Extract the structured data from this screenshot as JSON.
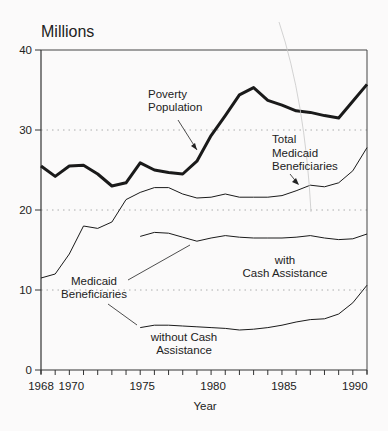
{
  "chart_data": {
    "type": "line",
    "title": "Millions",
    "xlabel": "Year",
    "ylabel": "Millions",
    "xlim": [
      1968,
      1991
    ],
    "ylim": [
      0,
      40
    ],
    "x_ticks": [
      1968,
      1970,
      1975,
      1980,
      1985,
      1990
    ],
    "y_ticks": [
      0,
      10,
      20,
      30,
      40
    ],
    "grid": "dotted horizontal at 10, 20, 30",
    "legend": "none (inline annotations)",
    "x": [
      1968,
      1969,
      1970,
      1971,
      1972,
      1973,
      1974,
      1975,
      1976,
      1977,
      1978,
      1979,
      1980,
      1981,
      1982,
      1983,
      1984,
      1985,
      1986,
      1987,
      1988,
      1989,
      1990,
      1991
    ],
    "series": [
      {
        "name": "Poverty Population",
        "style": "thick",
        "values": [
          25.5,
          24.2,
          25.5,
          25.6,
          24.5,
          23.0,
          23.4,
          25.9,
          25.0,
          24.7,
          24.5,
          26.1,
          29.3,
          31.8,
          34.4,
          35.3,
          33.7,
          33.1,
          32.4,
          32.2,
          31.8,
          31.5,
          33.6,
          35.7
        ]
      },
      {
        "name": "Total Medicaid Beneficiaries",
        "style": "thin",
        "values": [
          11.5,
          12.0,
          14.5,
          18.0,
          17.7,
          18.5,
          21.3,
          22.2,
          22.8,
          22.8,
          22.0,
          21.5,
          21.6,
          22.0,
          21.6,
          21.6,
          21.6,
          21.8,
          22.4,
          23.1,
          22.9,
          23.4,
          24.9,
          27.8
        ]
      },
      {
        "name": "Medicaid Beneficiaries with Cash Assistance",
        "style": "thin",
        "values": [
          null,
          null,
          null,
          null,
          null,
          null,
          null,
          16.7,
          17.2,
          17.1,
          16.6,
          16.1,
          16.5,
          16.8,
          16.6,
          16.5,
          16.5,
          16.5,
          16.6,
          16.8,
          16.5,
          16.3,
          16.4,
          17.0
        ]
      },
      {
        "name": "Medicaid Beneficiaries without Cash Assistance",
        "style": "thin",
        "values": [
          null,
          null,
          null,
          null,
          null,
          null,
          null,
          5.3,
          5.6,
          5.6,
          5.5,
          5.4,
          5.3,
          5.2,
          5.0,
          5.1,
          5.3,
          5.6,
          6.0,
          6.3,
          6.4,
          7.0,
          8.4,
          10.6
        ]
      }
    ],
    "annotations": [
      {
        "text": [
          "Poverty",
          "Population"
        ],
        "points_to": "Poverty Population"
      },
      {
        "text": [
          "Total",
          "Medicaid",
          "Beneficiaries"
        ],
        "points_to": "Total Medicaid Beneficiaries"
      },
      {
        "text": [
          "with",
          "Cash Assistance"
        ],
        "points_to": "Medicaid Beneficiaries with Cash Assistance"
      },
      {
        "text": [
          "Medicaid",
          "Beneficiaries"
        ],
        "points_to": "with/without Cash Assistance"
      },
      {
        "text": [
          "without Cash",
          "Assistance"
        ],
        "points_to": "Medicaid Beneficiaries without Cash Assistance"
      }
    ]
  },
  "labels": {
    "title": "Millions",
    "xlabel": "Year",
    "poverty": [
      "Poverty",
      "Population"
    ],
    "total": [
      "Total",
      "Medicaid",
      "Beneficiaries"
    ],
    "with_cash": [
      "with",
      "Cash Assistance"
    ],
    "medicaid": [
      "Medicaid",
      "Beneficiaries"
    ],
    "without_cash": [
      "without Cash",
      "Assistance"
    ]
  }
}
